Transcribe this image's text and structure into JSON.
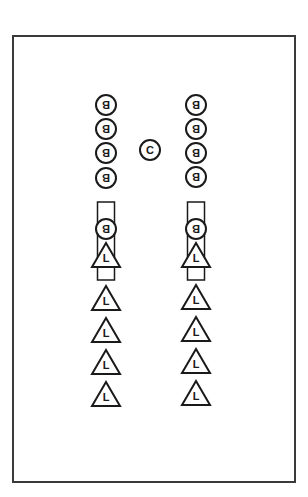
{
  "diagram": {
    "title": "",
    "colors": {
      "stroke": "#1a1a1a",
      "background": "#ffffff",
      "frame": "#3a3a3a"
    },
    "center_marker": {
      "label": "C",
      "x": 150,
      "y": 150
    },
    "columns": [
      {
        "name": "left",
        "x": 106,
        "circles": [
          {
            "label": "B",
            "y": 105
          },
          {
            "label": "B",
            "y": 129
          },
          {
            "label": "B",
            "y": 153
          },
          {
            "label": "B",
            "y": 178
          }
        ],
        "stem": {
          "y_top": 202,
          "y_bottom": 280,
          "width": 17,
          "circle_label": "B",
          "circle_y": 229,
          "triangle_label": "L",
          "triangle_apex_y": 243
        },
        "triangles": [
          {
            "label": "L",
            "apex_y": 286
          },
          {
            "label": "L",
            "apex_y": 318
          },
          {
            "label": "L",
            "apex_y": 350
          },
          {
            "label": "L",
            "apex_y": 382
          }
        ]
      },
      {
        "name": "right",
        "x": 196,
        "circles": [
          {
            "label": "B",
            "y": 105
          },
          {
            "label": "B",
            "y": 129
          },
          {
            "label": "B",
            "y": 153
          },
          {
            "label": "B",
            "y": 177
          }
        ],
        "stem": {
          "y_top": 202,
          "y_bottom": 280,
          "width": 17,
          "circle_label": "B",
          "circle_y": 229,
          "triangle_label": "L",
          "triangle_apex_y": 243
        },
        "triangles": [
          {
            "label": "L",
            "apex_y": 285
          },
          {
            "label": "L",
            "apex_y": 317
          },
          {
            "label": "L",
            "apex_y": 349
          },
          {
            "label": "L",
            "apex_y": 381
          }
        ]
      }
    ]
  }
}
